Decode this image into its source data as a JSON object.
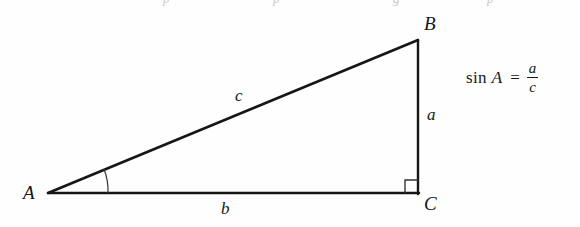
{
  "figure": {
    "kind": "right-triangle-diagram",
    "background_color": "#fefefe",
    "stroke_color": "#161616",
    "canvas": {
      "width": 580,
      "height": 227
    },
    "vertices": {
      "A": {
        "label": "A",
        "x": 48,
        "y": 193
      },
      "B": {
        "label": "B",
        "x": 418,
        "y": 40
      },
      "C": {
        "label": "C",
        "x": 418,
        "y": 193
      }
    },
    "sides": {
      "a": {
        "label": "a",
        "from": "B",
        "to": "C",
        "description": "opposite side, vertical"
      },
      "b": {
        "label": "b",
        "from": "A",
        "to": "C",
        "description": "adjacent side, horizontal base"
      },
      "c": {
        "label": "c",
        "from": "A",
        "to": "B",
        "description": "hypotenuse"
      }
    },
    "markers": {
      "angle_arc_at_A": true,
      "right_angle_square_at_C": true
    }
  },
  "formula": {
    "function_name": "sin",
    "argument": "A",
    "equals": "=",
    "numerator": "a",
    "denominator": "c",
    "plain_text": "sin A = a/c"
  },
  "top_artifacts": [
    {
      "text": "p",
      "left": 163
    },
    {
      "text": "p",
      "left": 273
    },
    {
      "text": "g",
      "left": 393
    },
    {
      "text": "p",
      "left": 487
    }
  ]
}
